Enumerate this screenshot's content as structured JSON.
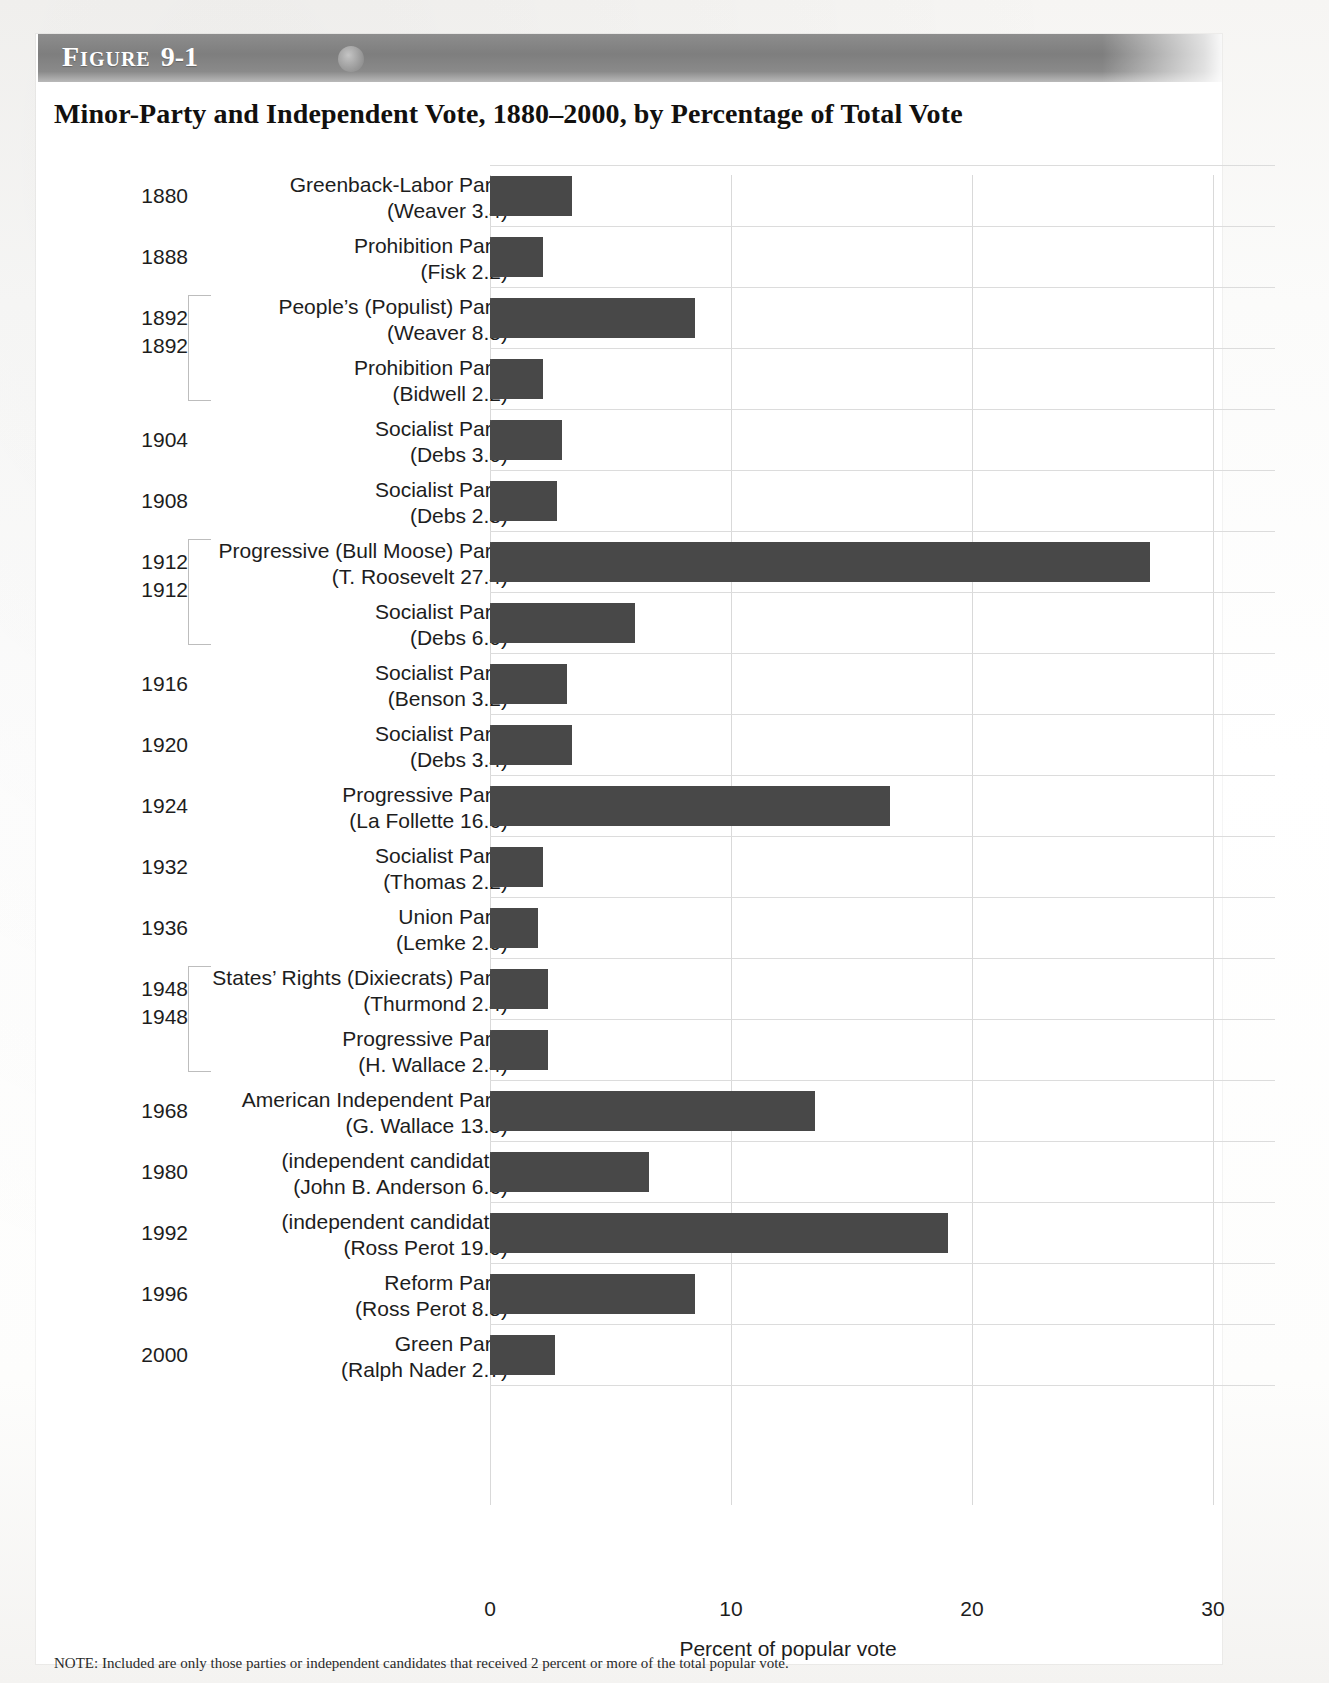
{
  "figure": {
    "banner_label": "Figure",
    "banner_number": "9-1",
    "title": "Minor-Party and Independent Vote, 1880–2000, by Percentage of Total Vote",
    "note": "NOTE: Included are only those parties or independent candidates that received 2 percent or more of the total popular vote."
  },
  "chart_data": {
    "type": "bar",
    "orientation": "horizontal",
    "title": "Minor-Party and Independent Vote, 1880–2000, by Percentage of Total Vote",
    "xlabel": "Percent of popular vote",
    "ylabel": "",
    "xlim": [
      0,
      30
    ],
    "xticks": [
      "0",
      "10",
      "20",
      "30"
    ],
    "xtick_values": [
      0,
      10,
      20,
      30
    ],
    "grid": "vertical-and-row-separators",
    "legend": "none",
    "bar_color": "#4a4a4a",
    "categories": [
      "1880 Greenback-Labor Party (Weaver)",
      "1888 Prohibition Party (Fisk)",
      "1892 People's (Populist) Party (Weaver)",
      "1892 Prohibition Party (Bidwell)",
      "1904 Socialist Party (Debs)",
      "1908 Socialist Party (Debs)",
      "1912 Progressive (Bull Moose) Party (T. Roosevelt)",
      "1912 Socialist Party (Debs)",
      "1916 Socialist Party (Benson)",
      "1920 Socialist Party (Debs)",
      "1924 Progressive Party (La Follette)",
      "1932 Socialist Party (Thomas)",
      "1936 Union Party (Lemke)",
      "1948 States' Rights (Dixiecrats) Party (Thurmond)",
      "1948 Progressive Party (H. Wallace)",
      "1968 American Independent Party (G. Wallace)",
      "1980 (independent candidate) (John B. Anderson)",
      "1992 (independent candidate) (Ross Perot)",
      "1996 Reform Party (Ross Perot)",
      "2000 Green Party (Ralph Nader)"
    ],
    "values": [
      3.4,
      2.2,
      8.5,
      2.2,
      3.0,
      2.8,
      27.4,
      6.0,
      3.2,
      3.4,
      16.6,
      2.2,
      2.0,
      2.4,
      2.4,
      13.5,
      6.6,
      19.0,
      8.5,
      2.7
    ]
  },
  "rows": [
    {
      "year": "1880",
      "party": "Greenback-Labor Party",
      "candidate": "(Weaver 3.4)",
      "value": 3.4,
      "group": null
    },
    {
      "year": "1888",
      "party": "Prohibition Party",
      "candidate": "(Fisk 2.2)",
      "value": 2.2,
      "group": null
    },
    {
      "year": "1892",
      "party": "People’s (Populist) Party",
      "candidate": "(Weaver 8.5)",
      "value": 8.5,
      "group": "start"
    },
    {
      "year": "",
      "party": "Prohibition Party",
      "candidate": "(Bidwell 2.2)",
      "value": 2.2,
      "group": "end"
    },
    {
      "year": "1904",
      "party": "Socialist Party",
      "candidate": "(Debs 3.0)",
      "value": 3.0,
      "group": null
    },
    {
      "year": "1908",
      "party": "Socialist Party",
      "candidate": "(Debs 2.8)",
      "value": 2.8,
      "group": null
    },
    {
      "year": "1912",
      "party": "Progressive (Bull Moose) Party",
      "candidate": "(T. Roosevelt 27.4)",
      "value": 27.4,
      "group": "start"
    },
    {
      "year": "",
      "party": "Socialist Party",
      "candidate": "(Debs 6.0)",
      "value": 6.0,
      "group": "end"
    },
    {
      "year": "1916",
      "party": "Socialist Party",
      "candidate": "(Benson 3.2)",
      "value": 3.2,
      "group": null
    },
    {
      "year": "1920",
      "party": "Socialist Party",
      "candidate": "(Debs 3.4)",
      "value": 3.4,
      "group": null
    },
    {
      "year": "1924",
      "party": "Progressive Party",
      "candidate": "(La Follette 16.6)",
      "value": 16.6,
      "group": null
    },
    {
      "year": "1932",
      "party": "Socialist Party",
      "candidate": "(Thomas 2.2)",
      "value": 2.2,
      "group": null
    },
    {
      "year": "1936",
      "party": "Union Party",
      "candidate": "(Lemke 2.0)",
      "value": 2.0,
      "group": null
    },
    {
      "year": "1948",
      "party": "States’ Rights (Dixiecrats) Party",
      "candidate": "(Thurmond 2.4)",
      "value": 2.4,
      "group": "start"
    },
    {
      "year": "",
      "party": "Progressive Party",
      "candidate": "(H. Wallace 2.4)",
      "value": 2.4,
      "group": "end"
    },
    {
      "year": "1968",
      "party": "American Independent Party",
      "candidate": "(G. Wallace 13.5)",
      "value": 13.5,
      "group": null
    },
    {
      "year": "1980",
      "party": "(independent candidate)",
      "candidate": "(John B. Anderson 6.6)",
      "value": 6.6,
      "group": null
    },
    {
      "year": "1992",
      "party": "(independent candidate)",
      "candidate": "(Ross Perot 19.0)",
      "value": 19.0,
      "group": null
    },
    {
      "year": "1996",
      "party": "Reform Party",
      "candidate": "(Ross Perot 8.5)",
      "value": 8.5,
      "group": null
    },
    {
      "year": "2000",
      "party": "Green Party",
      "candidate": "(Ralph Nader 2.7)",
      "value": 2.7,
      "group": null
    }
  ],
  "group_year_labels": [
    {
      "label": "1892",
      "row_index": 2
    },
    {
      "label": "1912",
      "row_index": 6
    },
    {
      "label": "1948",
      "row_index": 13
    }
  ],
  "axis": {
    "ticks": [
      "0",
      "10",
      "20",
      "30"
    ],
    "title": "Percent of popular vote"
  }
}
